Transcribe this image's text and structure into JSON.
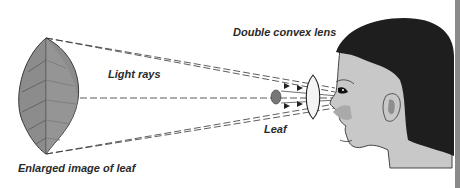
{
  "diagram": {
    "labels": {
      "light_rays": "Light rays",
      "double_convex_lens": "Double convex lens",
      "leaf": "Leaf",
      "enlarged_image": "Enlarged image of leaf"
    },
    "elements": {
      "enlarged_leaf": "enlarged-leaf-image",
      "small_leaf": "actual-leaf",
      "lens": "double-convex-lens",
      "observer": "human-head-profile",
      "rays": "dashed-light-rays"
    },
    "colors": {
      "leaf_fill": "#8c8c8c",
      "skin": "#c8c8c8",
      "hair": "#1e1e1e",
      "ray": "#333333",
      "edge_bar": "#8a8a8a"
    }
  }
}
